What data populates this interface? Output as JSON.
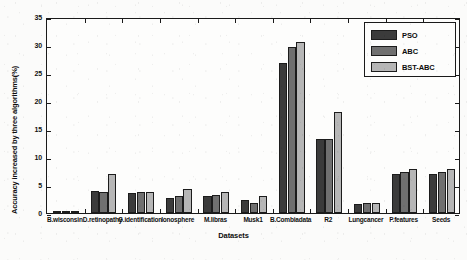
{
  "chart_data": {
    "type": "bar",
    "title": "",
    "xlabel": "Datasets",
    "ylabel": "Accuracy increased by three algorithms(%)",
    "ylim": [
      0,
      35
    ],
    "yticks": [
      0,
      5,
      10,
      15,
      20,
      25,
      30,
      35
    ],
    "grid": false,
    "legend_position": "top-right",
    "categories": [
      "B.wisconsin",
      "D.retinopathy",
      "G.identification",
      "Ionosphere",
      "M.libras",
      "Musk1",
      "B.Combiadata",
      "R2",
      "Lungcancer",
      "P.features",
      "Seeds"
    ],
    "series": [
      {
        "name": "PSO",
        "color": "#3b3b3b",
        "values": [
          0.25,
          4.0,
          3.6,
          2.6,
          3.1,
          2.4,
          26.8,
          13.2,
          1.6,
          6.9,
          7.0
        ]
      },
      {
        "name": "ABC",
        "color": "#707070",
        "values": [
          0.3,
          3.8,
          3.7,
          3.0,
          3.2,
          1.7,
          29.7,
          13.2,
          1.7,
          7.4,
          7.4
        ]
      },
      {
        "name": "BST-ABC",
        "color": "#b6b6b6",
        "values": [
          0.35,
          6.9,
          3.7,
          4.2,
          3.7,
          3.0,
          30.6,
          18.1,
          1.8,
          7.8,
          7.8
        ]
      }
    ]
  },
  "legend": {
    "items": [
      {
        "label": "PSO"
      },
      {
        "label": "ABC"
      },
      {
        "label": "BST-ABC"
      }
    ]
  }
}
